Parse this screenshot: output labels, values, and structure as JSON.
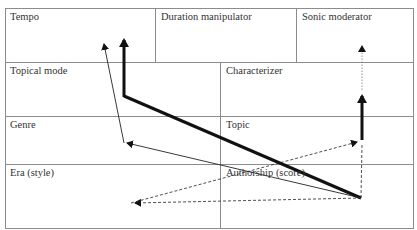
{
  "diagram": {
    "cells": [
      {
        "id": "tempo",
        "label": "Tempo",
        "x": 5,
        "y": 8
      },
      {
        "id": "duration-manipulator",
        "label": "Duration manipulator",
        "x": 155,
        "y": 8
      },
      {
        "id": "sonic-moderator",
        "label": "Sonic moderator",
        "x": 296,
        "y": 8
      },
      {
        "id": "topical-mode",
        "label": "Topical mode",
        "x": 5,
        "y": 62
      },
      {
        "id": "characterizer",
        "label": "Characterizer",
        "x": 220,
        "y": 62
      },
      {
        "id": "genre",
        "label": "Genre",
        "x": 5,
        "y": 116
      },
      {
        "id": "topic",
        "label": "Topic",
        "x": 220,
        "y": 116
      },
      {
        "id": "era-style",
        "label": "Era (style)",
        "x": 5,
        "y": 164
      },
      {
        "id": "authorship-score",
        "label": "Authorship (score)",
        "x": 220,
        "y": 164
      }
    ],
    "colors": {
      "grid": "#8c8c8c",
      "arrow": "#111111",
      "text": "#333333"
    }
  }
}
